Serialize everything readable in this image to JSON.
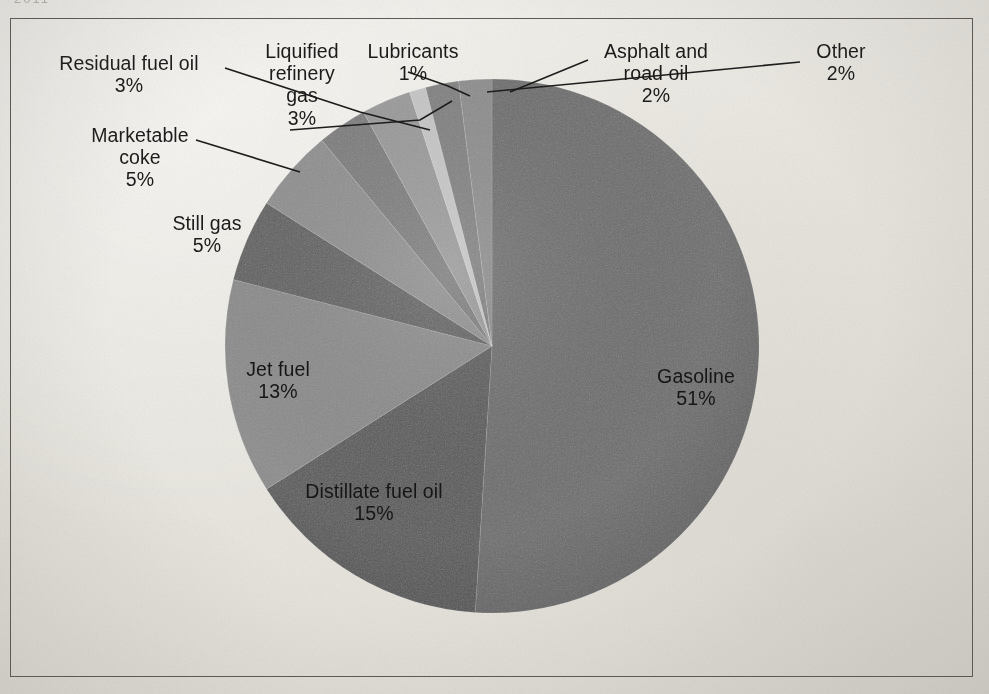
{
  "frame": {
    "top_crumb": "2011",
    "border_color": "#5d5a55",
    "background_color": "#eceae4"
  },
  "chart_data": {
    "type": "pie",
    "title": "",
    "subtitle": "",
    "xlabel": "",
    "ylabel": "",
    "legend_position": "none",
    "grid": false,
    "labels_inside": [
      "Gasoline",
      "Distillate fuel oil",
      "Jet fuel"
    ],
    "total_percent": 100,
    "start_angle_deg": -90,
    "direction": "clockwise",
    "categories": [
      "Gasoline",
      "Distillate fuel oil",
      "Jet fuel",
      "Still gas",
      "Marketable coke",
      "Residual fuel oil",
      "Liquified refinery gas",
      "Lubricants",
      "Asphalt and road oil",
      "Other"
    ],
    "values": [
      51,
      15,
      13,
      5,
      5,
      3,
      3,
      1,
      2,
      2
    ],
    "value_labels": [
      "51%",
      "15%",
      "13%",
      "5%",
      "5%",
      "3%",
      "3%",
      "1%",
      "2%",
      "2%"
    ],
    "colors": [
      "#6b6b6b",
      "#575757",
      "#8a8a8a",
      "#5e5e5e",
      "#8f8f8f",
      "#7b7b7b",
      "#9a9a9a",
      "#c9c9c9",
      "#7f7f7f",
      "#8c8c8c"
    ]
  },
  "labels": [
    {
      "name": "residual-fuel-oil",
      "text": "Residual fuel oil",
      "pct": "3%"
    },
    {
      "name": "marketable-coke",
      "text": "Marketable",
      "text2": "coke",
      "pct": "5%"
    },
    {
      "name": "still-gas",
      "text": "Still gas",
      "pct": "5%"
    },
    {
      "name": "liquified-refinery-gas",
      "text": "Liquified",
      "text2": "refinery",
      "text3": "gas",
      "pct": "3%"
    },
    {
      "name": "lubricants",
      "text": "Lubricants",
      "pct": "1%"
    },
    {
      "name": "asphalt-and-road-oil",
      "text": "Asphalt and",
      "text2": "road oil",
      "pct": "2%"
    },
    {
      "name": "other",
      "text": "Other",
      "pct": "2%"
    },
    {
      "name": "gasoline",
      "text": "Gasoline",
      "pct": "51%"
    },
    {
      "name": "distillate-fuel-oil",
      "text": "Distillate fuel oil",
      "pct": "15%"
    },
    {
      "name": "jet-fuel",
      "text": "Jet fuel",
      "pct": "13%"
    }
  ]
}
